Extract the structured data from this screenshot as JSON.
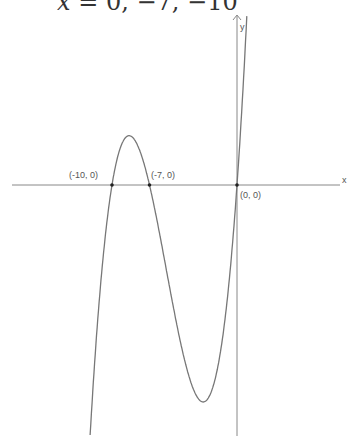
{
  "header": {
    "equation_var": "x",
    "equation_rest": " = 0,  −7,  −10"
  },
  "chart_data": {
    "type": "line",
    "title": "",
    "function": "y = a·x(x+7)(x+10)",
    "xlabel": "x",
    "ylabel": "y",
    "roots": [
      [
        -10,
        0
      ],
      [
        -7,
        0
      ],
      [
        0,
        0
      ]
    ],
    "annotations": [
      {
        "text": "(-10, 0)",
        "x": -10,
        "y": 0
      },
      {
        "text": "(-7, 0)",
        "x": -7,
        "y": 0
      },
      {
        "text": "(0, 0)",
        "x": 0,
        "y": 0
      }
    ],
    "local_max_approx": [
      -8.7,
      19.2
    ],
    "local_min_approx": [
      -2.7,
      -84.7
    ],
    "grid": false,
    "pixel_mapping": {
      "origin_px": [
        237,
        185
      ],
      "x_scale": 12.5,
      "y_scale": 2.56
    },
    "x_range": [
      -11.75,
      8.8
    ],
    "curve_color": "#777777",
    "axis_color": "#888888"
  }
}
